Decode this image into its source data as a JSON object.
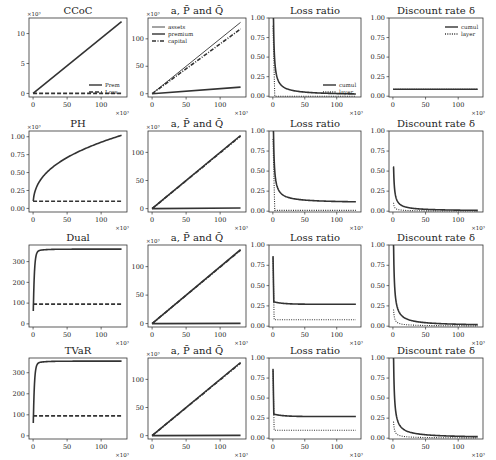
{
  "figure": {
    "rows": [
      "CCoC",
      "PH",
      "Dual",
      "TVaR"
    ],
    "columns": [
      "distortion",
      "a, P-bar and Q-bar",
      "Loss ratio",
      "Discount rate delta"
    ]
  },
  "chart_data": [
    {
      "row": 0,
      "col": 0,
      "type": "line",
      "title": "CCoC",
      "y_multiplier": "×10³",
      "x_multiplier": "×10³",
      "ylim": [
        -0.6,
        12.6
      ],
      "yticks": [
        0,
        5,
        10
      ],
      "xlim": [
        -6,
        138
      ],
      "xticks": [
        0,
        50,
        100
      ],
      "legend": {
        "position": "lower right",
        "entries": [
          "Prem",
          "Loss"
        ]
      },
      "series": [
        {
          "name": "Prem",
          "style": "solid",
          "x": [
            0,
            130
          ],
          "y": [
            0,
            12
          ]
        },
        {
          "name": "Loss",
          "style": "dashed",
          "x": [
            0,
            130
          ],
          "y": [
            0,
            0
          ]
        }
      ]
    },
    {
      "row": 0,
      "col": 1,
      "type": "line",
      "title": "a, P̄ and Q̄",
      "y_multiplier": "×10³",
      "x_multiplier": "×10³",
      "ylim": [
        -6,
        138
      ],
      "yticks": [
        0,
        50,
        100
      ],
      "xlim": [
        -6,
        138
      ],
      "xticks": [
        0,
        50,
        100
      ],
      "legend": {
        "position": "upper left",
        "entries": [
          "assets",
          "premium",
          "capital"
        ]
      },
      "series": [
        {
          "name": "assets",
          "style": "solid-thin",
          "x": [
            0,
            130
          ],
          "y": [
            0,
            130
          ]
        },
        {
          "name": "premium",
          "style": "solid",
          "x": [
            0,
            130
          ],
          "y": [
            0,
            12
          ]
        },
        {
          "name": "capital",
          "style": "dashdot",
          "x": [
            0,
            130
          ],
          "y": [
            0,
            118
          ]
        }
      ]
    },
    {
      "row": 0,
      "col": 2,
      "type": "line",
      "title": "Loss ratio",
      "x_multiplier": "×10³",
      "ylim": [
        -0.01,
        1.0
      ],
      "yticks": [
        0.0,
        0.25,
        0.5,
        0.75,
        1.0
      ],
      "xlim": [
        -6,
        138
      ],
      "xticks": [
        0,
        50,
        100
      ],
      "legend": {
        "position": "lower right",
        "entries": [
          "cumul",
          "layer"
        ]
      },
      "series": [
        {
          "name": "cumul",
          "style": "solid",
          "shape": "decay",
          "start": 1.0,
          "end": 0.01
        },
        {
          "name": "layer",
          "style": "dotted",
          "shape": "drop",
          "start": 1.0,
          "end": 0.0
        }
      ]
    },
    {
      "row": 0,
      "col": 3,
      "type": "line",
      "title": "Discount rate δ",
      "x_multiplier": "×10³",
      "ylim": [
        -0.01,
        1.0
      ],
      "yticks": [
        0.0,
        0.25,
        0.5,
        0.75,
        1.0
      ],
      "xlim": [
        -6,
        138
      ],
      "xticks": [
        0,
        50,
        100
      ],
      "legend": {
        "position": "upper right",
        "entries": [
          "cumul",
          "layer"
        ]
      },
      "series": [
        {
          "name": "cumul",
          "style": "solid",
          "shape": "flat",
          "start": 0.09,
          "end": 0.09
        },
        {
          "name": "layer",
          "style": "dotted",
          "shape": "flat",
          "start": 0.09,
          "end": 0.09
        }
      ]
    },
    {
      "row": 1,
      "col": 0,
      "type": "line",
      "title": "PH",
      "y_multiplier": "×10³",
      "x_multiplier": "×10³",
      "ylim": [
        -0.05,
        1.08
      ],
      "yticks": [
        0.0,
        0.25,
        0.5,
        0.75,
        1.0
      ],
      "xlim": [
        -6,
        138
      ],
      "xticks": [
        0,
        50,
        100
      ],
      "series": [
        {
          "name": "Prem",
          "style": "solid",
          "shape": "concave",
          "start": 0,
          "end": 1.02
        },
        {
          "name": "Loss",
          "style": "dashed",
          "x": [
            0,
            130
          ],
          "y": [
            0.1,
            0.1
          ]
        }
      ]
    },
    {
      "row": 1,
      "col": 1,
      "type": "line",
      "title": "a, P̄ and Q̄",
      "y_multiplier": "×10³",
      "x_multiplier": "×10³",
      "ylim": [
        -6,
        138
      ],
      "yticks": [
        0,
        50,
        100
      ],
      "xlim": [
        -6,
        138
      ],
      "xticks": [
        0,
        50,
        100
      ],
      "series": [
        {
          "name": "assets",
          "style": "solid",
          "x": [
            0,
            130
          ],
          "y": [
            0,
            130
          ]
        },
        {
          "name": "capital",
          "style": "dashdot",
          "x": [
            0,
            130
          ],
          "y": [
            0,
            129
          ]
        },
        {
          "name": "premium",
          "style": "solid",
          "x": [
            0,
            130
          ],
          "y": [
            0,
            1
          ]
        }
      ]
    },
    {
      "row": 1,
      "col": 2,
      "type": "line",
      "title": "Loss ratio",
      "x_multiplier": "×10³",
      "ylim": [
        -0.01,
        1.0
      ],
      "yticks": [
        0.0,
        0.25,
        0.5,
        0.75,
        1.0
      ],
      "xlim": [
        -6,
        138
      ],
      "xticks": [
        0,
        50,
        100
      ],
      "series": [
        {
          "name": "cumul",
          "style": "solid",
          "shape": "decay",
          "start": 1.0,
          "end": 0.1
        },
        {
          "name": "layer",
          "style": "dotted",
          "shape": "drop",
          "start": 1.0,
          "end": 0.01
        }
      ]
    },
    {
      "row": 1,
      "col": 3,
      "type": "line",
      "title": "Discount rate δ",
      "x_multiplier": "×10³",
      "ylim": [
        -0.01,
        1.0
      ],
      "yticks": [
        0.0,
        0.25,
        0.5,
        0.75,
        1.0
      ],
      "xlim": [
        -6,
        138
      ],
      "xticks": [
        0,
        50,
        100
      ],
      "series": [
        {
          "name": "cumul",
          "style": "solid",
          "shape": "decay",
          "start": 0.55,
          "end": 0.0
        },
        {
          "name": "layer",
          "style": "dotted",
          "shape": "decay",
          "start": 0.1,
          "end": 0.0
        }
      ]
    },
    {
      "row": 2,
      "col": 0,
      "type": "line",
      "title": "Dual",
      "x_multiplier": "×10³",
      "ylim": [
        -15,
        380
      ],
      "yticks": [
        0,
        100,
        200,
        300
      ],
      "xlim": [
        -6,
        138
      ],
      "xticks": [
        0,
        50,
        100
      ],
      "series": [
        {
          "name": "Prem",
          "style": "solid",
          "shape": "saturating",
          "start": 0,
          "end": 360
        },
        {
          "name": "Loss",
          "style": "dashed",
          "x": [
            0,
            130
          ],
          "y": [
            95,
            95
          ]
        }
      ]
    },
    {
      "row": 2,
      "col": 1,
      "type": "line",
      "title": "a, P̄ and Q̄",
      "y_multiplier": "×10³",
      "x_multiplier": "×10³",
      "ylim": [
        -6,
        138
      ],
      "yticks": [
        0,
        50,
        100
      ],
      "xlim": [
        -6,
        138
      ],
      "xticks": [
        0,
        50,
        100
      ],
      "series": [
        {
          "name": "assets",
          "style": "solid",
          "x": [
            0,
            130
          ],
          "y": [
            0,
            130
          ]
        },
        {
          "name": "capital",
          "style": "dashdot",
          "x": [
            0,
            130
          ],
          "y": [
            0,
            129
          ]
        },
        {
          "name": "premium",
          "style": "solid",
          "x": [
            0,
            130
          ],
          "y": [
            0,
            0.4
          ]
        }
      ]
    },
    {
      "row": 2,
      "col": 2,
      "type": "line",
      "title": "Loss ratio",
      "x_multiplier": "×10³",
      "ylim": [
        -0.01,
        1.0
      ],
      "yticks": [
        0.0,
        0.25,
        0.5,
        0.75,
        1.0
      ],
      "xlim": [
        -6,
        138
      ],
      "xticks": [
        0,
        50,
        100
      ],
      "series": [
        {
          "name": "cumul",
          "style": "solid",
          "shape": "step-decay",
          "start": 1.0,
          "end": 0.27
        },
        {
          "name": "layer",
          "style": "dotted",
          "shape": "step-drop",
          "start": 1.0,
          "end": 0.08
        }
      ]
    },
    {
      "row": 2,
      "col": 3,
      "type": "line",
      "title": "Discount rate δ",
      "x_multiplier": "×10³",
      "ylim": [
        -0.01,
        1.0
      ],
      "yticks": [
        0.0,
        0.25,
        0.5,
        0.75,
        1.0
      ],
      "xlim": [
        -6,
        138
      ],
      "xticks": [
        0,
        50,
        100
      ],
      "series": [
        {
          "name": "cumul",
          "style": "solid",
          "shape": "decay",
          "start": 1.0,
          "end": 0.0
        },
        {
          "name": "layer",
          "style": "dotted",
          "shape": "decay",
          "start": 0.2,
          "end": 0.0
        }
      ]
    },
    {
      "row": 3,
      "col": 0,
      "type": "line",
      "title": "TVaR",
      "x_multiplier": "×10³",
      "ylim": [
        -15,
        370
      ],
      "yticks": [
        0,
        100,
        200,
        300
      ],
      "xlim": [
        -6,
        138
      ],
      "xticks": [
        0,
        50,
        100
      ],
      "series": [
        {
          "name": "Prem",
          "style": "solid",
          "shape": "saturating",
          "start": 0,
          "end": 355
        },
        {
          "name": "Loss",
          "style": "dashed",
          "x": [
            0,
            130
          ],
          "y": [
            95,
            95
          ]
        }
      ]
    },
    {
      "row": 3,
      "col": 1,
      "type": "line",
      "title": "a, P̄ and Q̄",
      "y_multiplier": "×10³",
      "x_multiplier": "×10³",
      "ylim": [
        -6,
        138
      ],
      "yticks": [
        0,
        50,
        100
      ],
      "xlim": [
        -6,
        138
      ],
      "xticks": [
        0,
        50,
        100
      ],
      "series": [
        {
          "name": "assets",
          "style": "solid",
          "x": [
            0,
            130
          ],
          "y": [
            0,
            130
          ]
        },
        {
          "name": "capital",
          "style": "dashdot",
          "x": [
            0,
            130
          ],
          "y": [
            0,
            129
          ]
        },
        {
          "name": "premium",
          "style": "solid",
          "x": [
            0,
            130
          ],
          "y": [
            0,
            0.4
          ]
        }
      ]
    },
    {
      "row": 3,
      "col": 2,
      "type": "line",
      "title": "Loss ratio",
      "x_multiplier": "×10³",
      "ylim": [
        -0.01,
        1.0
      ],
      "yticks": [
        0.0,
        0.25,
        0.5,
        0.75,
        1.0
      ],
      "xlim": [
        -6,
        138
      ],
      "xticks": [
        0,
        50,
        100
      ],
      "series": [
        {
          "name": "cumul",
          "style": "solid",
          "shape": "step-decay",
          "start": 1.0,
          "end": 0.27
        },
        {
          "name": "layer",
          "style": "dotted",
          "shape": "step-drop",
          "start": 1.0,
          "end": 0.1
        }
      ]
    },
    {
      "row": 3,
      "col": 3,
      "type": "line",
      "title": "Discount rate δ",
      "x_multiplier": "×10³",
      "ylim": [
        -0.01,
        1.0
      ],
      "yticks": [
        0.0,
        0.25,
        0.5,
        0.75,
        1.0
      ],
      "xlim": [
        -6,
        138
      ],
      "xticks": [
        0,
        50,
        100
      ],
      "series": [
        {
          "name": "cumul",
          "style": "solid",
          "shape": "decay",
          "start": 1.0,
          "end": 0.0
        },
        {
          "name": "layer",
          "style": "dotted",
          "shape": "decay",
          "start": 0.2,
          "end": 0.0
        }
      ]
    }
  ]
}
